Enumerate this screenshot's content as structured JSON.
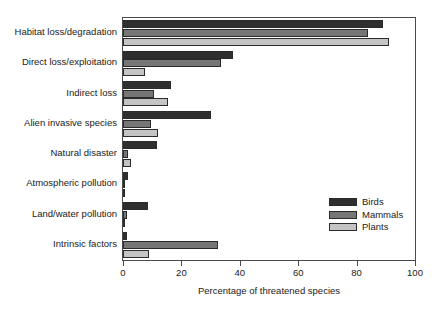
{
  "chart_data": {
    "type": "bar",
    "orientation": "horizontal",
    "title": "",
    "xlabel": "Percentage of threatened species",
    "ylabel": "",
    "xlim": [
      0,
      100
    ],
    "xticks": [
      0,
      20,
      40,
      60,
      80,
      100
    ],
    "xticklabels": [
      "0",
      "20",
      "40",
      "60",
      "80",
      "100"
    ],
    "grid": false,
    "legend_position": "lower right",
    "categories": [
      "Habitat loss/degradation",
      "Direct loss/exploitation",
      "Indirect loss",
      "Alien invasive species",
      "Natural disaster",
      "Atmospheric pollution",
      "Land/water pollution",
      "Intrinsic factors"
    ],
    "series": [
      {
        "name": "Birds",
        "color": "#2f2f2f",
        "values": [
          89,
          37.5,
          16.5,
          30,
          11.5,
          1.7,
          8.5,
          1.5
        ]
      },
      {
        "name": "Mammals",
        "color": "#767676",
        "values": [
          84,
          33.5,
          10.5,
          9.5,
          1.7,
          0.4,
          1.2,
          32.5
        ]
      },
      {
        "name": "Plants",
        "color": "#c4c4c4",
        "values": [
          91,
          7.5,
          15.5,
          12,
          2.7,
          0.2,
          0.8,
          9
        ]
      }
    ]
  }
}
